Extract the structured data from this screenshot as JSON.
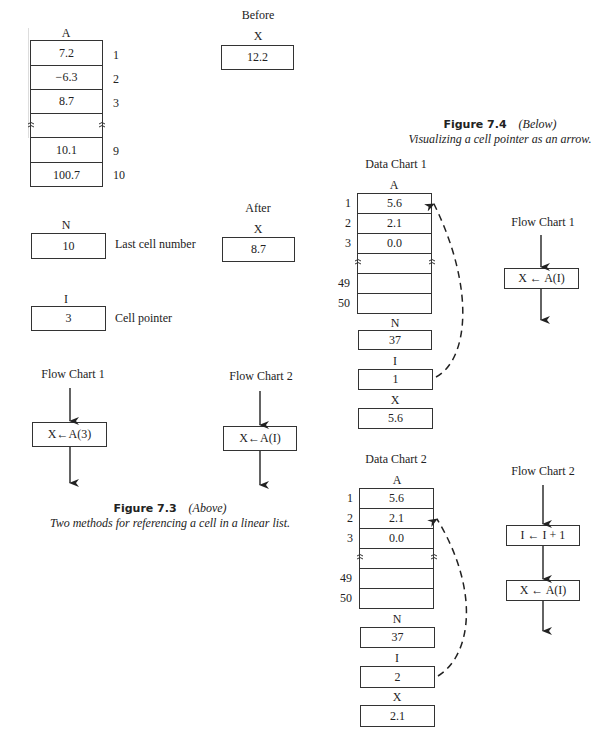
{
  "figure_7_3": {
    "array_A": {
      "label": "A",
      "cells": [
        {
          "index": "1",
          "value": "7.2"
        },
        {
          "index": "2",
          "value": "−6.3"
        },
        {
          "index": "3",
          "value": "8.7"
        },
        {
          "index": "",
          "value": ""
        },
        {
          "index": "9",
          "value": "10.1"
        },
        {
          "index": "10",
          "value": "100.7"
        }
      ]
    },
    "before": {
      "heading": "Before",
      "var_label": "X",
      "value": "12.2"
    },
    "after": {
      "heading": "After",
      "var_label": "X",
      "value": "8.7"
    },
    "N": {
      "label": "N",
      "value": "10",
      "description": "Last cell number"
    },
    "I": {
      "label": "I",
      "value": "3",
      "description": "Cell pointer"
    },
    "flow_chart_1": {
      "title": "Flow Chart 1",
      "step": "X←A(3)"
    },
    "flow_chart_2": {
      "title": "Flow Chart 2",
      "step": "X←A(I)"
    },
    "caption": {
      "figure": "Figure 7.3",
      "position": "(Above)",
      "text": "Two methods for referencing a cell in a linear list."
    }
  },
  "figure_7_4": {
    "caption": {
      "figure": "Figure 7.4",
      "position": "(Below)",
      "text": "Visualizing a cell pointer as an arrow."
    },
    "data_chart_1": {
      "title": "Data Chart 1",
      "array_label": "A",
      "cells": [
        {
          "index": "1",
          "value": "5.6"
        },
        {
          "index": "2",
          "value": "2.1"
        },
        {
          "index": "3",
          "value": "0.0"
        },
        {
          "index": "",
          "value": ""
        },
        {
          "index": "49",
          "value": ""
        },
        {
          "index": "50",
          "value": ""
        }
      ],
      "N": {
        "label": "N",
        "value": "37"
      },
      "I": {
        "label": "I",
        "value": "1"
      },
      "X": {
        "label": "X",
        "value": "5.6"
      }
    },
    "flow_chart_1": {
      "title": "Flow Chart 1",
      "steps": [
        "X ← A(I)"
      ]
    },
    "data_chart_2": {
      "title": "Data Chart 2",
      "array_label": "A",
      "cells": [
        {
          "index": "1",
          "value": "5.6"
        },
        {
          "index": "2",
          "value": "2.1"
        },
        {
          "index": "3",
          "value": "0.0"
        },
        {
          "index": "",
          "value": ""
        },
        {
          "index": "49",
          "value": ""
        },
        {
          "index": "50",
          "value": ""
        }
      ],
      "N": {
        "label": "N",
        "value": "37"
      },
      "I": {
        "label": "I",
        "value": "2"
      },
      "X": {
        "label": "X",
        "value": "2.1"
      }
    },
    "flow_chart_2": {
      "title": "Flow Chart 2",
      "steps": [
        "I ← I + 1",
        "X ← A(I)"
      ]
    }
  }
}
